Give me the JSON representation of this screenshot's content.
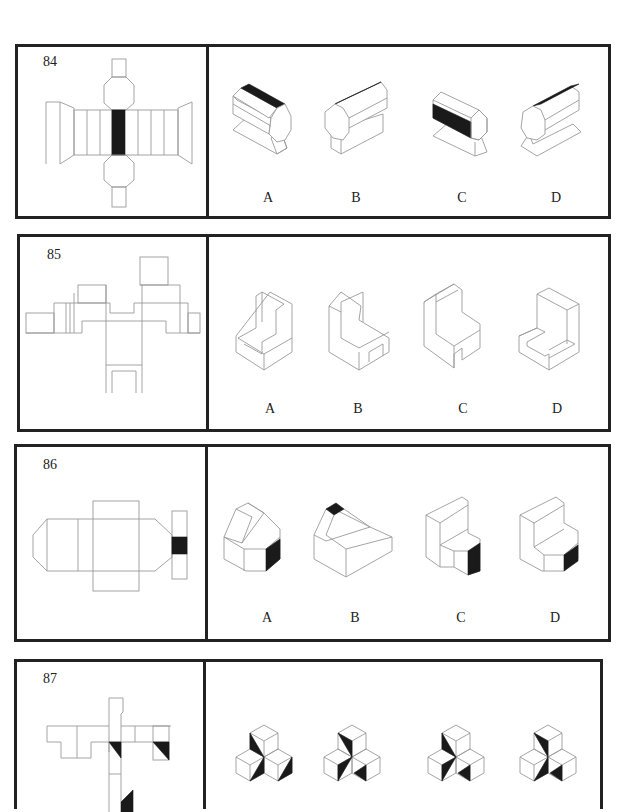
{
  "document": {
    "type": "spatial reasoning worksheet — cube/solid net folding questions",
    "ink_color": "#222222",
    "line_color": "#9a9a9a",
    "fill_color": "#1a1a1a"
  },
  "questions": [
    {
      "number": "84",
      "net_description": "Net of an octagonal prism with a black strip on the central face, octagonal end caps above/below with small rectangular tabs, and trapezoidal side flaps",
      "options": [
        {
          "label": "A",
          "description": "Octagonal prism on trapezoid base, black strip on top face"
        },
        {
          "label": "B",
          "description": "Octagonal prism on rectangular base, black strip on top face"
        },
        {
          "label": "C",
          "description": "Octagonal prism on trapezoid base, black strip on front-left face"
        },
        {
          "label": "D",
          "description": "Octagonal prism on trapezoid base facing left, black strip on top face"
        }
      ]
    },
    {
      "number": "85",
      "net_description": "Complex net with L-shaped and notched panels",
      "options": [
        {
          "label": "A",
          "description": "Chair-like solid with ledge and notch at front"
        },
        {
          "label": "B",
          "description": "Chair-like solid with tall back and open legs"
        },
        {
          "label": "C",
          "description": "Chair-like solid with lip on top back and open legs"
        },
        {
          "label": "D",
          "description": "Block with tall back and low U-shaped front walls"
        }
      ]
    },
    {
      "number": "86",
      "net_description": "Net with hexagonal end face, rectangular panels, and a side strip with a black square",
      "options": [
        {
          "label": "A",
          "description": "Beveled solid with black face on lower right"
        },
        {
          "label": "B",
          "description": "Beveled solid with black square on top"
        },
        {
          "label": "C",
          "description": "Stepped solid with black face on lower right"
        },
        {
          "label": "D",
          "description": "Chamfered step solid with black face on lower right"
        }
      ]
    },
    {
      "number": "87",
      "net_description": "Net of squares with black triangular markings",
      "options": [
        {
          "label": "A",
          "description": "Three-cube cluster with black triangles"
        },
        {
          "label": "B",
          "description": "Three-cube cluster with black triangles"
        },
        {
          "label": "C",
          "description": "Three-cube cluster with black triangles"
        },
        {
          "label": "D",
          "description": "Three-cube cluster with black triangles"
        }
      ]
    }
  ]
}
